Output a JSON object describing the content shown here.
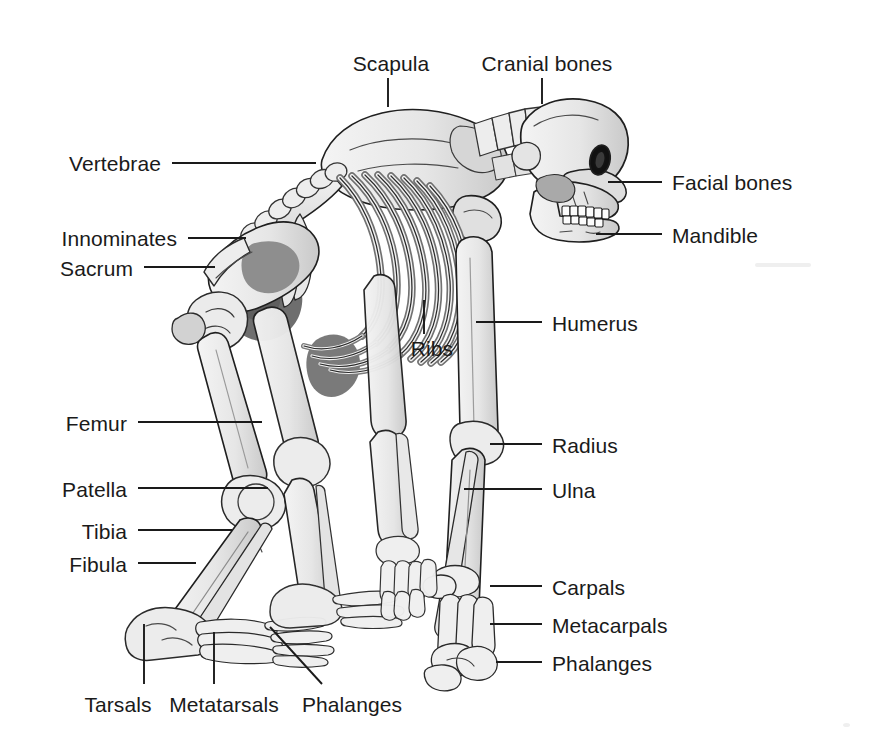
{
  "figure": {
    "background_color": "#ffffff",
    "line_color": "#1a1a1a",
    "text_color": "#1a1a1a",
    "bone_fill": "#ececec",
    "bone_shade_mid": "#bdbdbd",
    "bone_shade_dark": "#7d7d7d",
    "bone_shade_darkest": "#5a5a5a",
    "width": 889,
    "height": 743
  },
  "labels": [
    {
      "id": "scapula",
      "text": "Scapula",
      "x": 391,
      "y": 63,
      "anchor": "center"
    },
    {
      "id": "cranial",
      "text": "Cranial bones",
      "x": 547,
      "y": 63,
      "anchor": "center"
    },
    {
      "id": "vertebrae",
      "text": "Vertebrae",
      "x": 161,
      "y": 163,
      "anchor": "right"
    },
    {
      "id": "facial",
      "text": "Facial bones",
      "x": 672,
      "y": 182,
      "anchor": "left"
    },
    {
      "id": "innominates",
      "text": "Innominates",
      "x": 177,
      "y": 238,
      "anchor": "right"
    },
    {
      "id": "mandible",
      "text": "Mandible",
      "x": 672,
      "y": 235,
      "anchor": "left"
    },
    {
      "id": "sacrum",
      "text": "Sacrum",
      "x": 133,
      "y": 268,
      "anchor": "right"
    },
    {
      "id": "humerus",
      "text": "Humerus",
      "x": 552,
      "y": 323,
      "anchor": "left"
    },
    {
      "id": "ribs",
      "text": "Ribs",
      "x": 432,
      "y": 348,
      "anchor": "center"
    },
    {
      "id": "femur",
      "text": "Femur",
      "x": 127,
      "y": 423,
      "anchor": "right"
    },
    {
      "id": "radius",
      "text": "Radius",
      "x": 552,
      "y": 445,
      "anchor": "left"
    },
    {
      "id": "patella",
      "text": "Patella",
      "x": 127,
      "y": 489,
      "anchor": "right"
    },
    {
      "id": "ulna",
      "text": "Ulna",
      "x": 552,
      "y": 490,
      "anchor": "left"
    },
    {
      "id": "tibia",
      "text": "Tibia",
      "x": 127,
      "y": 531,
      "anchor": "right"
    },
    {
      "id": "fibula",
      "text": "Fibula",
      "x": 127,
      "y": 564,
      "anchor": "right"
    },
    {
      "id": "carpals",
      "text": "Carpals",
      "x": 552,
      "y": 587,
      "anchor": "left"
    },
    {
      "id": "metacarpals",
      "text": "Metacarpals",
      "x": 552,
      "y": 625,
      "anchor": "left"
    },
    {
      "id": "phalanges-hand",
      "text": "Phalanges",
      "x": 552,
      "y": 663,
      "anchor": "left"
    },
    {
      "id": "tarsals",
      "text": "Tarsals",
      "x": 118,
      "y": 704,
      "anchor": "center"
    },
    {
      "id": "metatarsals",
      "text": "Metatarsals",
      "x": 224,
      "y": 704,
      "anchor": "center"
    },
    {
      "id": "phalanges-foot",
      "text": "Phalanges",
      "x": 352,
      "y": 704,
      "anchor": "center"
    }
  ],
  "leader_lines": [
    {
      "for": "scapula",
      "x1": 388,
      "y1": 78,
      "x2": 388,
      "y2": 107
    },
    {
      "for": "cranial",
      "x1": 542,
      "y1": 78,
      "x2": 542,
      "y2": 104
    },
    {
      "for": "vertebrae",
      "x1": 172,
      "y1": 163,
      "x2": 316,
      "y2": 163
    },
    {
      "for": "facial",
      "x1": 608,
      "y1": 182,
      "x2": 662,
      "y2": 182
    },
    {
      "for": "innominates",
      "x1": 188,
      "y1": 238,
      "x2": 246,
      "y2": 238
    },
    {
      "for": "mandible",
      "x1": 596,
      "y1": 234,
      "x2": 662,
      "y2": 234
    },
    {
      "for": "sacrum",
      "x1": 144,
      "y1": 267,
      "x2": 215,
      "y2": 267
    },
    {
      "for": "humerus",
      "x1": 476,
      "y1": 322,
      "x2": 542,
      "y2": 322
    },
    {
      "for": "ribs",
      "x1": 424,
      "y1": 300,
      "x2": 424,
      "y2": 334
    },
    {
      "for": "femur",
      "x1": 138,
      "y1": 422,
      "x2": 262,
      "y2": 422
    },
    {
      "for": "radius",
      "x1": 490,
      "y1": 444,
      "x2": 542,
      "y2": 444
    },
    {
      "for": "patella",
      "x1": 138,
      "y1": 488,
      "x2": 268,
      "y2": 488
    },
    {
      "for": "ulna",
      "x1": 464,
      "y1": 489,
      "x2": 542,
      "y2": 489
    },
    {
      "for": "tibia",
      "x1": 138,
      "y1": 530,
      "x2": 232,
      "y2": 530
    },
    {
      "for": "fibula",
      "x1": 138,
      "y1": 563,
      "x2": 196,
      "y2": 563
    },
    {
      "for": "carpals",
      "x1": 490,
      "y1": 586,
      "x2": 542,
      "y2": 586
    },
    {
      "for": "metacarpals",
      "x1": 490,
      "y1": 624,
      "x2": 542,
      "y2": 624
    },
    {
      "for": "phalanges-hand",
      "x1": 496,
      "y1": 662,
      "x2": 542,
      "y2": 662
    },
    {
      "for": "tarsals",
      "x1": 144,
      "y1": 624,
      "x2": 144,
      "y2": 684
    },
    {
      "for": "metatarsals",
      "x1": 214,
      "y1": 632,
      "x2": 214,
      "y2": 684
    },
    {
      "for": "phalanges-foot",
      "x1": 270,
      "y1": 627,
      "x2": 322,
      "y2": 684
    }
  ],
  "bone_groups": [
    "cranial bones",
    "facial bones",
    "mandible",
    "cervical vertebrae",
    "thoracic vertebrae",
    "lumbar vertebrae",
    "sacrum",
    "scapula",
    "ribs",
    "innominates",
    "humerus",
    "radius",
    "ulna",
    "carpals",
    "metacarpals",
    "phalanges (hand)",
    "femur",
    "patella",
    "tibia",
    "fibula",
    "tarsals",
    "metatarsals",
    "phalanges (foot)"
  ]
}
